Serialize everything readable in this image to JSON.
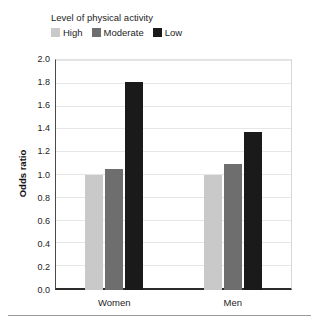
{
  "legend": {
    "title": "Level of physical activity",
    "items": [
      {
        "label": "High",
        "color": "#c9c9c9",
        "swatch_name": "legend-swatch-high"
      },
      {
        "label": "Moderate",
        "color": "#6e6e6e",
        "swatch_name": "legend-swatch-moderate"
      },
      {
        "label": "Low",
        "color": "#1a1a1a",
        "swatch_name": "legend-swatch-low"
      }
    ]
  },
  "axis": {
    "ylabel": "Odds ratio",
    "yticks": [
      "0.0",
      "0.2",
      "0.4",
      "0.6",
      "0.8",
      "1.0",
      "1.2",
      "1.4",
      "1.6",
      "1.8",
      "2.0"
    ]
  },
  "chart_data": {
    "type": "bar",
    "title": "Level of physical activity",
    "categories": [
      "Women",
      "Men"
    ],
    "series": [
      {
        "name": "High",
        "color": "#c9c9c9",
        "values": [
          1.0,
          1.0
        ]
      },
      {
        "name": "Moderate",
        "color": "#6e6e6e",
        "values": [
          1.05,
          1.09
        ]
      },
      {
        "name": "Low",
        "color": "#1a1a1a",
        "values": [
          1.8,
          1.37
        ]
      }
    ],
    "xlabel": "",
    "ylabel": "Odds ratio",
    "ylim": [
      0.0,
      2.0
    ],
    "ytick_step": 0.2,
    "grid": "horizontal",
    "legend_position": "top-left"
  }
}
